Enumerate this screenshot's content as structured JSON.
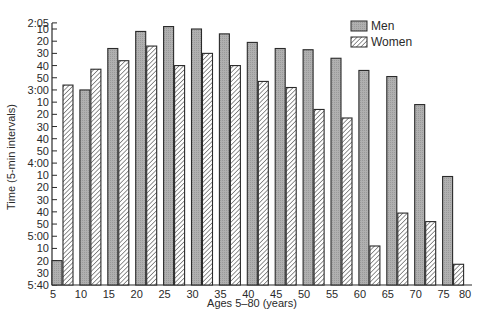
{
  "chart_data": {
    "type": "bar",
    "title": "",
    "xlabel": "Ages 5–80 (years)",
    "ylabel": "Time (5-min intervals)",
    "y_inverted": true,
    "y_unit": "h:mm",
    "ylim": [
      "2:05",
      "5:40"
    ],
    "y_ticks": [
      "2:05",
      "10",
      "20",
      "30",
      "40",
      "50",
      "3:00",
      "10",
      "20",
      "30",
      "40",
      "50",
      "4:00",
      "10",
      "20",
      "30",
      "40",
      "50",
      "5:00",
      "10",
      "20",
      "30",
      "5:40"
    ],
    "x_tick_labels": [
      "5",
      "10",
      "15",
      "20",
      "25",
      "30",
      "35",
      "40",
      "45",
      "50",
      "55",
      "60",
      "65",
      "70",
      "75",
      "80"
    ],
    "categories": [
      "5",
      "10",
      "15",
      "20",
      "25",
      "30",
      "35",
      "40",
      "45",
      "50",
      "55",
      "60",
      "65",
      "70",
      "75"
    ],
    "series": [
      {
        "name": "Men",
        "pattern": "solid-gray",
        "values": [
          "5:20",
          "3:00",
          "2:26",
          "2:12",
          "2:08",
          "2:10",
          "2:14",
          "2:21",
          "2:26",
          "2:27",
          "2:34",
          "2:44",
          "2:49",
          "3:12",
          "4:11"
        ],
        "values_minutes": [
          320,
          180,
          146,
          132,
          128,
          130,
          134,
          141,
          146,
          147,
          154,
          164,
          169,
          192,
          251
        ]
      },
      {
        "name": "Women",
        "pattern": "hatched",
        "values": [
          "2:56",
          "2:43",
          "2:36",
          "2:24",
          "2:40",
          "2:30",
          "2:40",
          "2:53",
          "2:58",
          "3:16",
          "3:23",
          "5:08",
          "4:41",
          "4:48",
          "5:23"
        ],
        "values_minutes": [
          176,
          163,
          156,
          144,
          160,
          150,
          160,
          173,
          178,
          196,
          203,
          308,
          281,
          288,
          323
        ]
      }
    ],
    "grid": false,
    "legend_position": "top-right"
  },
  "legend": {
    "men_label": "Men",
    "women_label": "Women"
  },
  "axes": {
    "x_title": "Ages 5–80 (years)",
    "y_title": "Time (5-min intervals)"
  },
  "colors": {
    "men_fill": "#a9a9a9",
    "women_hatch": "#3a3a3a",
    "outline": "#2a2a2a"
  }
}
